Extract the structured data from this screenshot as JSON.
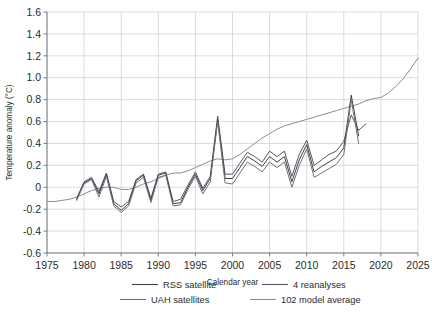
{
  "chart_data": {
    "type": "line",
    "title": "",
    "xlabel": "Calendar year",
    "ylabel": "Temperature anomaly (°C)",
    "xlim": [
      1975,
      2025
    ],
    "ylim": [
      -0.6,
      1.6
    ],
    "xticks": [
      1975,
      1980,
      1985,
      1990,
      1995,
      2000,
      2005,
      2010,
      2015,
      2020,
      2025
    ],
    "yticks": [
      -0.6,
      -0.4,
      -0.2,
      0,
      0.2,
      0.4,
      0.6,
      0.8,
      1.0,
      1.2,
      1.4,
      1.6
    ],
    "xtick_labels": [
      "1975",
      "1980",
      "1985",
      "1990",
      "1995",
      "2000",
      "2005",
      "2010",
      "2015",
      "2020",
      "2025"
    ],
    "ytick_labels": [
      "-0.6",
      "-0.4",
      "-0.2",
      "0",
      "0.2",
      "0.4",
      "0.6",
      "0.8",
      "1.0",
      "1.2",
      "1.4",
      "1.6"
    ],
    "grid": true,
    "legend_position": "bottom",
    "series": [
      {
        "name": "102 model average",
        "color": "#8a8f95",
        "width": 1.0,
        "x": [
          1975,
          1976,
          1977,
          1978,
          1979,
          1980,
          1981,
          1982,
          1983,
          1984,
          1985,
          1986,
          1987,
          1988,
          1989,
          1990,
          1991,
          1992,
          1993,
          1994,
          1995,
          1996,
          1997,
          1998,
          1999,
          2000,
          2001,
          2002,
          2003,
          2004,
          2005,
          2006,
          2007,
          2008,
          2009,
          2010,
          2011,
          2012,
          2013,
          2014,
          2015,
          2016,
          2017,
          2018,
          2019,
          2020,
          2021,
          2022,
          2023,
          2024,
          2025
        ],
        "y": [
          -0.13,
          -0.13,
          -0.12,
          -0.11,
          -0.09,
          -0.06,
          -0.03,
          -0.01,
          0.0,
          0.0,
          -0.02,
          -0.02,
          0.0,
          0.03,
          0.05,
          0.08,
          0.11,
          0.13,
          0.13,
          0.15,
          0.18,
          0.21,
          0.24,
          0.26,
          0.25,
          0.26,
          0.3,
          0.35,
          0.4,
          0.45,
          0.49,
          0.53,
          0.56,
          0.58,
          0.6,
          0.62,
          0.64,
          0.66,
          0.68,
          0.7,
          0.72,
          0.74,
          0.76,
          0.79,
          0.81,
          0.82,
          0.86,
          0.92,
          0.99,
          1.08,
          1.18
        ]
      },
      {
        "name": "4 reanalyses",
        "color": "#55595e",
        "width": 1.0,
        "x": [
          1979,
          1980,
          1981,
          1982,
          1983,
          1984,
          1985,
          1986,
          1987,
          1988,
          1989,
          1990,
          1991,
          1992,
          1993,
          1994,
          1995,
          1996,
          1997,
          1998,
          1999,
          2000,
          2001,
          2002,
          2003,
          2004,
          2005,
          2006,
          2007,
          2008,
          2009,
          2010,
          2011,
          2012,
          2013,
          2014,
          2015,
          2016,
          2017,
          2018
        ],
        "y": [
          -0.1,
          0.05,
          0.09,
          -0.04,
          0.13,
          -0.13,
          -0.18,
          -0.13,
          0.07,
          0.12,
          -0.1,
          0.12,
          0.14,
          -0.13,
          -0.11,
          0.02,
          0.14,
          -0.01,
          0.1,
          0.65,
          0.12,
          0.12,
          0.22,
          0.32,
          0.28,
          0.23,
          0.33,
          0.28,
          0.33,
          0.1,
          0.3,
          0.43,
          0.2,
          0.25,
          0.3,
          0.33,
          0.42,
          0.66,
          0.52,
          0.58
        ]
      },
      {
        "name": "RSS satellite",
        "color": "#3d4146",
        "width": 1.0,
        "x": [
          1979,
          1980,
          1981,
          1982,
          1983,
          1984,
          1985,
          1986,
          1987,
          1988,
          1989,
          1990,
          1991,
          1992,
          1993,
          1994,
          1995,
          1996,
          1997,
          1998,
          1999,
          2000,
          2001,
          2002,
          2003,
          2004,
          2005,
          2006,
          2007,
          2008,
          2009,
          2010,
          2011,
          2012,
          2013,
          2014,
          2015,
          2016,
          2017
        ],
        "y": [
          -0.11,
          0.04,
          0.08,
          -0.06,
          0.12,
          -0.15,
          -0.21,
          -0.15,
          0.06,
          0.11,
          -0.12,
          0.11,
          0.13,
          -0.15,
          -0.14,
          0.0,
          0.12,
          -0.03,
          0.08,
          0.62,
          0.08,
          0.08,
          0.18,
          0.28,
          0.24,
          0.19,
          0.28,
          0.23,
          0.28,
          0.05,
          0.25,
          0.39,
          0.14,
          0.19,
          0.23,
          0.27,
          0.36,
          0.84,
          0.47
        ]
      },
      {
        "name": "UAH satellites",
        "color": "#6e7379",
        "width": 1.0,
        "x": [
          1979,
          1980,
          1981,
          1982,
          1983,
          1984,
          1985,
          1986,
          1987,
          1988,
          1989,
          1990,
          1991,
          1992,
          1993,
          1994,
          1995,
          1996,
          1997,
          1998,
          1999,
          2000,
          2001,
          2002,
          2003,
          2004,
          2005,
          2006,
          2007,
          2008,
          2009,
          2010,
          2011,
          2012,
          2013,
          2014,
          2015,
          2016,
          2017
        ],
        "y": [
          -0.12,
          0.03,
          0.07,
          -0.09,
          0.1,
          -0.17,
          -0.23,
          -0.17,
          0.04,
          0.09,
          -0.14,
          0.09,
          0.11,
          -0.17,
          -0.16,
          -0.02,
          0.1,
          -0.06,
          0.05,
          0.6,
          0.04,
          0.03,
          0.13,
          0.23,
          0.19,
          0.14,
          0.23,
          0.18,
          0.23,
          0.0,
          0.2,
          0.35,
          0.09,
          0.13,
          0.17,
          0.21,
          0.3,
          0.8,
          0.4
        ]
      }
    ],
    "legend_entries": [
      {
        "label": "RSS satellite",
        "color": "#3d4146"
      },
      {
        "label": "4 reanalyses",
        "color": "#55595e"
      },
      {
        "label": "UAH satellites",
        "color": "#6e7379"
      },
      {
        "label": "102 model average",
        "color": "#8a8f95"
      }
    ]
  }
}
